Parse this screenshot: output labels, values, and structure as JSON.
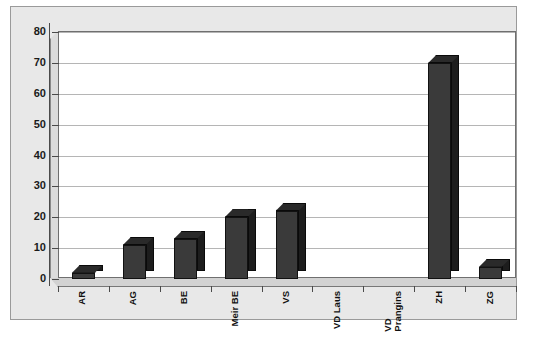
{
  "chart_data": {
    "type": "bar",
    "title": "",
    "subtitle": "",
    "xlabel": "",
    "ylabel": "",
    "categories": [
      "AR",
      "AG",
      "BE",
      "Meir BE",
      "VS",
      "VD Laus",
      "VD\nPrangins",
      "ZH",
      "ZG"
    ],
    "values": [
      2,
      11,
      13,
      20,
      22,
      0,
      0,
      70,
      4
    ],
    "ylim": [
      0,
      80
    ],
    "yticks": [
      0,
      10,
      20,
      30,
      40,
      50,
      60,
      70,
      80
    ],
    "ytick_labels": [
      "0",
      "10",
      "20",
      "30",
      "40",
      "50",
      "60",
      "70",
      "80"
    ],
    "grid": true,
    "legend": false,
    "legend_position": "none",
    "series": [
      {
        "name": "",
        "values": [
          2,
          11,
          13,
          20,
          22,
          0,
          0,
          70,
          4
        ]
      }
    ],
    "colors": {
      "bar_front": "#3a3a3a",
      "bar_side": "#1d1d1d",
      "bar_top": "#2a2a2a",
      "plot_background": "#ffffff",
      "frame_background": "#e8e8e8",
      "gridline": "#b5b5b5",
      "axis": "#4a4a4a",
      "text": "#111111"
    },
    "style": "3d-column"
  }
}
